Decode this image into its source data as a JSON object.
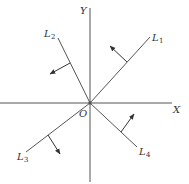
{
  "figure": {
    "axes": {
      "x_label": "X",
      "y_label": "Y",
      "origin_label": "O"
    },
    "lines": [
      {
        "name": "L",
        "sub": "1"
      },
      {
        "name": "L",
        "sub": "2"
      },
      {
        "name": "L",
        "sub": "3"
      },
      {
        "name": "L",
        "sub": "4"
      }
    ],
    "colors": {
      "stroke": "#555555",
      "text": "#333333",
      "background": "#ffffff"
    }
  }
}
